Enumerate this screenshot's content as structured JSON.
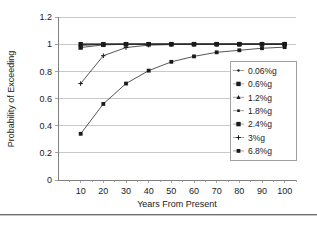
{
  "chart_data": {
    "type": "line",
    "title": "",
    "xlabel": "Years From Present",
    "ylabel": "Probability of Exceeding",
    "x": [
      10,
      20,
      30,
      40,
      50,
      60,
      70,
      80,
      90,
      100
    ],
    "xlim": [
      0,
      105
    ],
    "ylim": [
      0,
      1.2
    ],
    "xticks": [
      "10",
      "20",
      "30",
      "40",
      "50",
      "60",
      "70",
      "80",
      "90",
      "100"
    ],
    "yticks": [
      "0",
      "0.2",
      "0.4",
      "0.6",
      "0.8",
      "1",
      "1.2"
    ],
    "ytick_values": [
      0,
      0.2,
      0.4,
      0.6,
      0.8,
      1,
      1.2
    ],
    "grid": "horizontal",
    "legend_position": "right-middle",
    "series": [
      {
        "name": "0.06%g",
        "marker": "small-dot",
        "values": [
          1.0,
          1.0,
          1.0,
          1.0,
          1.0,
          1.0,
          1.0,
          1.0,
          1.0,
          1.0
        ]
      },
      {
        "name": "0.6%g",
        "marker": "square",
        "values": [
          1.0,
          1.0,
          1.0,
          1.0,
          1.0,
          1.0,
          1.0,
          1.0,
          1.0,
          1.0
        ]
      },
      {
        "name": "1.2%g",
        "marker": "triangle",
        "values": [
          1.0,
          1.0,
          1.0,
          1.0,
          1.0,
          1.0,
          1.0,
          1.0,
          1.0,
          1.0
        ]
      },
      {
        "name": "1.8%g",
        "marker": "tiny-square",
        "values": [
          0.99,
          1.0,
          1.0,
          1.0,
          1.0,
          1.0,
          1.0,
          1.0,
          1.0,
          1.0
        ]
      },
      {
        "name": "2.4%g",
        "marker": "square",
        "values": [
          0.975,
          0.995,
          0.999,
          1.0,
          1.0,
          1.0,
          1.0,
          1.0,
          1.0,
          1.0
        ]
      },
      {
        "name": "3%g",
        "marker": "plus",
        "values": [
          0.71,
          0.915,
          0.975,
          0.993,
          0.997,
          0.999,
          0.999,
          1.0,
          1.0,
          1.0
        ]
      },
      {
        "name": "6.8%g",
        "marker": "small-square",
        "values": [
          0.34,
          0.56,
          0.71,
          0.805,
          0.87,
          0.91,
          0.94,
          0.955,
          0.97,
          0.978
        ]
      }
    ]
  },
  "legend": {
    "entries": [
      "0.06%g",
      "0.6%g",
      "1.2%g",
      "1.8%g",
      "2.4%g",
      "3%g",
      "6.8%g"
    ]
  }
}
